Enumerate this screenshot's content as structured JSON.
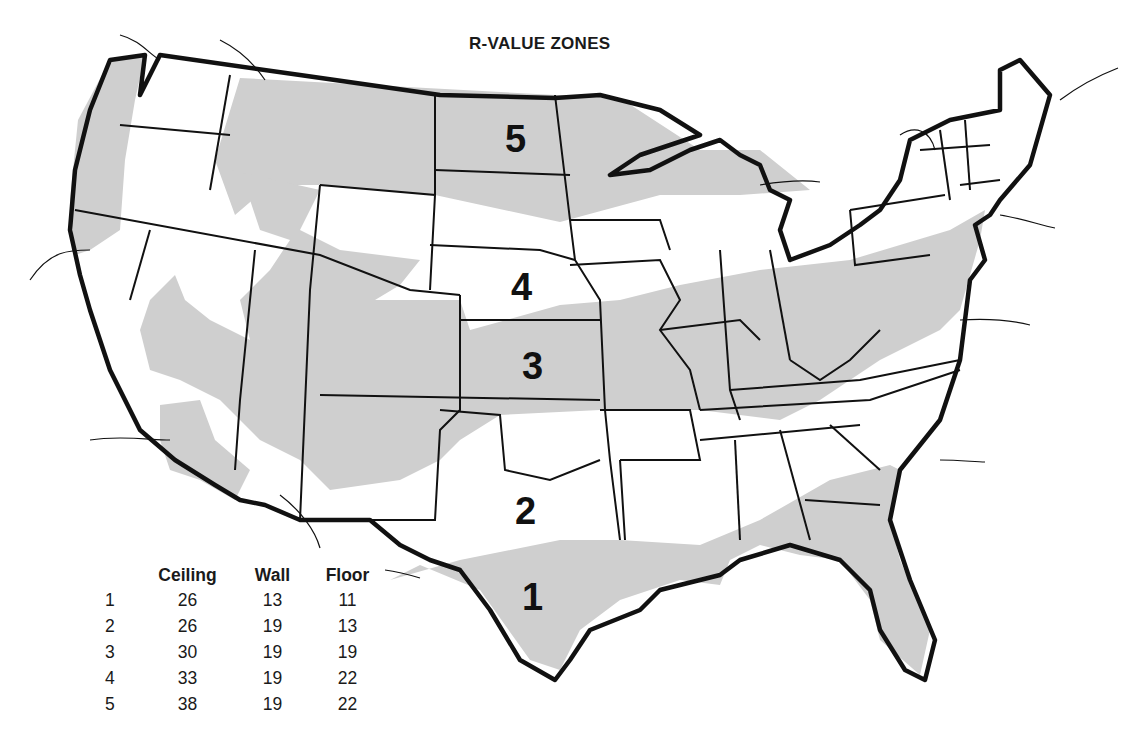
{
  "title": "R-VALUE ZONES",
  "colors": {
    "zone_fill": "#cfcfcf",
    "border": "#111111",
    "background": "#ffffff"
  },
  "zones": [
    {
      "id": "1",
      "label": "1",
      "x": 522,
      "y": 578
    },
    {
      "id": "2",
      "label": "2",
      "x": 515,
      "y": 492
    },
    {
      "id": "3",
      "label": "3",
      "x": 522,
      "y": 347
    },
    {
      "id": "4",
      "label": "4",
      "x": 511,
      "y": 268
    },
    {
      "id": "5",
      "label": "5",
      "x": 505,
      "y": 120
    }
  ],
  "legend": {
    "headers": [
      "",
      "Ceiling",
      "Wall",
      "Floor"
    ],
    "rows": [
      {
        "zone": "1",
        "ceiling": "26",
        "wall": "13",
        "floor": "11"
      },
      {
        "zone": "2",
        "ceiling": "26",
        "wall": "19",
        "floor": "13"
      },
      {
        "zone": "3",
        "ceiling": "30",
        "wall": "19",
        "floor": "19"
      },
      {
        "zone": "4",
        "ceiling": "33",
        "wall": "19",
        "floor": "22"
      },
      {
        "zone": "5",
        "ceiling": "38",
        "wall": "19",
        "floor": "22"
      }
    ]
  }
}
